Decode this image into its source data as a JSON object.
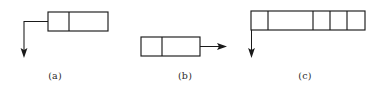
{
  "figure": {
    "type": "linked-list-node-diagram",
    "width": 386,
    "height": 95,
    "background_color": "#ffffff",
    "line_color": "#1a1a1a",
    "label_color": "#2b2b2b",
    "panels": [
      {
        "id": "a",
        "label": "(a)",
        "label_x": 55,
        "label_y": 70,
        "cells": 2,
        "box_x": 48,
        "box_y": 12,
        "box_width": 60,
        "box_height": 19,
        "dividers": [
          69
        ],
        "pointer": {
          "direction": "down-left",
          "description": "pointer leaves the left edge of the node, turns and points downward",
          "path": "M 48 21.5 L 24 21.5 L 24 50",
          "head_x": 24,
          "head_y": 58,
          "head_width": 7,
          "head_length": 9
        }
      },
      {
        "id": "b",
        "label": "(b)",
        "label_x": 185,
        "label_y": 70,
        "cells": 2,
        "box_x": 141,
        "box_y": 37,
        "box_width": 59,
        "box_height": 19,
        "dividers": [
          162
        ],
        "pointer": {
          "direction": "right",
          "description": "pointer leaves the right edge of the node and points to the right",
          "path": "M 200 46.5 L 218 46.5",
          "head_x": 227,
          "head_y": 46.5,
          "head_width": 7,
          "head_length": 9
        }
      },
      {
        "id": "c",
        "label": "(c)",
        "label_x": 305,
        "label_y": 70,
        "cells": 5,
        "box_x": 251,
        "box_y": 11,
        "box_width": 114,
        "box_height": 19,
        "dividers": [
          268,
          313,
          330,
          347
        ],
        "pointer": {
          "direction": "down",
          "description": "pointer descends from the left edge of the node and points downward",
          "path": "M 251.5 30 L 251.5 50",
          "head_x": 251.5,
          "head_y": 58,
          "head_width": 7,
          "head_length": 9
        }
      }
    ]
  }
}
